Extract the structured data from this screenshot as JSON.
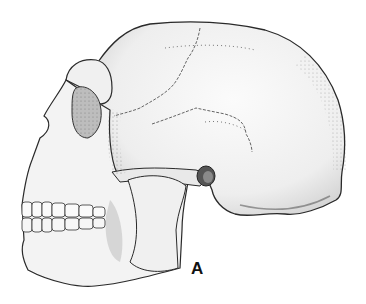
{
  "figure": {
    "label": "A",
    "colors": {
      "background": "#ffffff",
      "ink": "#2a2a2a",
      "bone": "#f2f2f2",
      "shade": "#cfcfcf"
    }
  }
}
